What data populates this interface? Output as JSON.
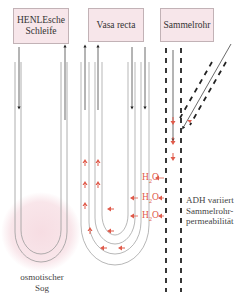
{
  "diagram": {
    "boxes": {
      "henle": [
        "HENLEsche",
        "Schleife"
      ],
      "vasa_recta": "Vasa recta",
      "sammelrohr": "Sammelrohr"
    },
    "labels": {
      "osmotic": [
        "osmotischer",
        "Sog"
      ],
      "adh": [
        "ADH variiert",
        "Sammelrohr-",
        "permeabilität"
      ]
    },
    "water_labels": [
      {
        "text": "H",
        "sub": "2",
        "rest": "O"
      },
      {
        "text": "H",
        "sub": "2",
        "rest": "O"
      },
      {
        "text": "H",
        "sub": "2",
        "rest": "O"
      }
    ],
    "colors": {
      "box_fill": "#f7e6ea",
      "arrow_red": "#e05a4a",
      "glow": "#f4d6dc",
      "line_gray": "#9a9a9a",
      "dash_black": "#222222"
    }
  }
}
